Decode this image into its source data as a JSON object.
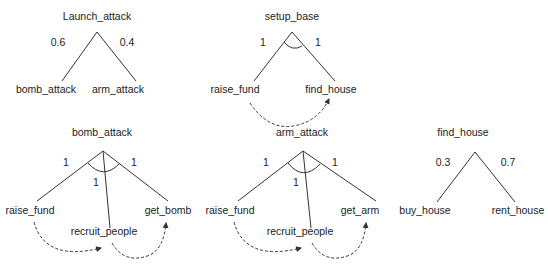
{
  "trees": [
    {
      "id": "launch_attack",
      "root": "Launch_attack",
      "type": "OR",
      "children": [
        "bomb_attack",
        "arm_attack"
      ],
      "edge_labels": [
        "0.6",
        "0.4"
      ]
    },
    {
      "id": "setup_base",
      "root": "setup_base",
      "type": "AND",
      "children": [
        "raise_fund",
        "find_house"
      ],
      "edge_labels": [
        "1",
        "1"
      ],
      "sequence": [
        "raise_fund",
        "find_house"
      ]
    },
    {
      "id": "bomb_attack",
      "root": "bomb_attack",
      "type": "AND",
      "children": [
        "raise_fund",
        "recruit_people",
        "get_bomb"
      ],
      "edge_labels": [
        "1",
        "1",
        "1"
      ],
      "sequence": [
        "raise_fund",
        "recruit_people",
        "get_bomb"
      ]
    },
    {
      "id": "arm_attack",
      "root": "arm_attack",
      "type": "AND",
      "children": [
        "raise_fund",
        "recruit_people",
        "get_arm"
      ],
      "edge_labels": [
        "1",
        "1",
        "1"
      ],
      "sequence": [
        "raise_fund",
        "recruit_people",
        "get_arm"
      ]
    },
    {
      "id": "find_house",
      "root": "find_house",
      "type": "OR",
      "children": [
        "buy_house",
        "rent_house"
      ],
      "edge_labels": [
        "0.3",
        "0.7"
      ]
    }
  ],
  "colors": {
    "line": "#333333",
    "text": "#222222",
    "background": "#ffffff"
  }
}
